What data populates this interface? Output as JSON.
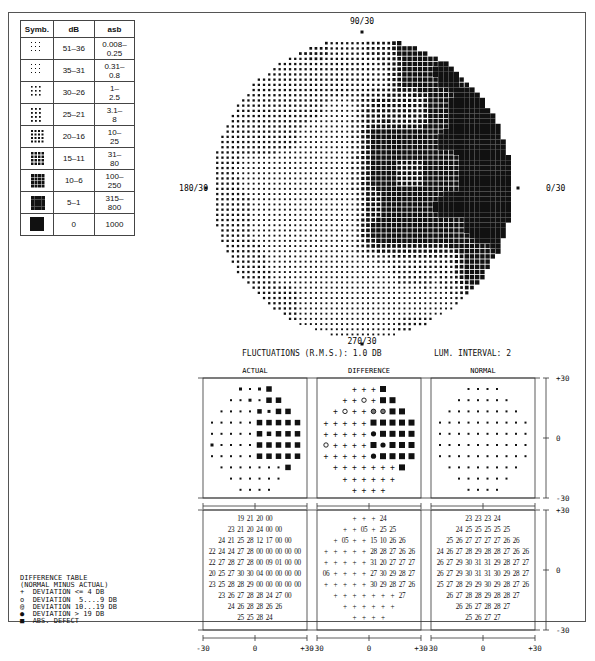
{
  "legend_table": {
    "headers": [
      "Symb.",
      "dB",
      "asb"
    ],
    "rows": [
      {
        "symbol": "dot-density-1",
        "db": "51–36",
        "asb": "0.008–0.25",
        "asb_l1": "0.008–",
        "asb_l2": "0.25"
      },
      {
        "symbol": "dot-density-2",
        "db": "35–31",
        "asb": "0.31–0.8",
        "asb_l1": "0.31–",
        "asb_l2": "0.8"
      },
      {
        "symbol": "dot-density-3",
        "db": "30–26",
        "asb": "1–2.5",
        "asb_l1": "1–",
        "asb_l2": "2.5"
      },
      {
        "symbol": "dot-density-4",
        "db": "25–21",
        "asb": "3.1–8",
        "asb_l1": "3.1–",
        "asb_l2": "8"
      },
      {
        "symbol": "dot-density-5",
        "db": "20–16",
        "asb": "10–25",
        "asb_l1": "10–",
        "asb_l2": "25"
      },
      {
        "symbol": "dot-density-6",
        "db": "15–11",
        "asb": "31–80",
        "asb_l1": "31–",
        "asb_l2": "80"
      },
      {
        "symbol": "dot-density-7",
        "db": "10–6",
        "asb": "100–250",
        "asb_l1": "100–",
        "asb_l2": "250"
      },
      {
        "symbol": "dot-density-8",
        "db": "5–1",
        "asb": "315–800",
        "asb_l1": "315–",
        "asb_l2": "800"
      },
      {
        "symbol": "solid-square",
        "db": "0",
        "asb": "1000",
        "asb_l1": "1000",
        "asb_l2": ""
      }
    ]
  },
  "field_plot": {
    "label_top": "90/30",
    "label_left": "180/30",
    "label_right": "0/30",
    "label_bottom": "270/30"
  },
  "stats": {
    "fluctuations": "FLUCTUATIONS (R.M.S.):  1.0 DB",
    "lum_interval": "LUM. INTERVAL: 2"
  },
  "panels": {
    "actual_title": "ACTUAL",
    "difference_title": "DIFFERENCE",
    "normal_title": "NORMAL",
    "x_ticks": [
      "-30",
      "0",
      "+30"
    ],
    "y_ticks": [
      "+30",
      "0",
      "-30"
    ]
  },
  "grid_rows_layout": [
    4,
    6,
    8,
    10,
    10,
    10,
    10,
    8,
    6,
    4
  ],
  "actual_values": [
    [
      "19",
      "21",
      "20",
      "00"
    ],
    [
      "23",
      "21",
      "20",
      "24",
      "00",
      "00"
    ],
    [
      "24",
      "21",
      "25",
      "28",
      "12",
      "17",
      "00",
      "00"
    ],
    [
      "22",
      "24",
      "24",
      "27",
      "28",
      "00",
      "00",
      "00",
      "00",
      "00"
    ],
    [
      "22",
      "27",
      "28",
      "27",
      "28",
      "00",
      "09",
      "01",
      "00",
      "00"
    ],
    [
      "20",
      "25",
      "27",
      "30",
      "30",
      "04",
      "00",
      "00",
      "00",
      "00"
    ],
    [
      "23",
      "25",
      "28",
      "28",
      "29",
      "00",
      "00",
      "00",
      "00",
      "00"
    ],
    [
      "23",
      "26",
      "27",
      "28",
      "28",
      "24",
      "27",
      "00"
    ],
    [
      "24",
      "26",
      "28",
      "28",
      "26",
      "26"
    ],
    [
      "25",
      "25",
      "28",
      "24"
    ]
  ],
  "difference_values": [
    [
      "+",
      "+",
      "+",
      "24"
    ],
    [
      "+",
      "+",
      "05",
      "+",
      "25",
      "25"
    ],
    [
      "+",
      "05",
      "+",
      "+",
      "15",
      "10",
      "26",
      "26"
    ],
    [
      "+",
      "+",
      "+",
      "+",
      "+",
      "28",
      "28",
      "27",
      "26",
      "26"
    ],
    [
      "+",
      "+",
      "+",
      "+",
      "+",
      "31",
      "20",
      "27",
      "27",
      "27"
    ],
    [
      "06",
      "+",
      "+",
      "+",
      "+",
      "27",
      "30",
      "29",
      "28",
      "27"
    ],
    [
      "+",
      "+",
      "+",
      "+",
      "+",
      "30",
      "29",
      "28",
      "27",
      "26"
    ],
    [
      "+",
      "+",
      "+",
      "+",
      "+",
      "+",
      "+",
      "27"
    ],
    [
      "+",
      "+",
      "+",
      "+",
      "+",
      "+"
    ],
    [
      "+",
      "+",
      "+",
      "+"
    ]
  ],
  "normal_values": [
    [
      "23",
      "23",
      "23",
      "24"
    ],
    [
      "24",
      "25",
      "25",
      "25",
      "25",
      "25"
    ],
    [
      "25",
      "26",
      "27",
      "27",
      "27",
      "27",
      "26",
      "26"
    ],
    [
      "24",
      "26",
      "27",
      "28",
      "29",
      "28",
      "28",
      "27",
      "26",
      "26"
    ],
    [
      "26",
      "27",
      "29",
      "30",
      "31",
      "31",
      "29",
      "28",
      "27",
      "27"
    ],
    [
      "26",
      "27",
      "29",
      "30",
      "31",
      "31",
      "30",
      "29",
      "28",
      "27"
    ],
    [
      "25",
      "27",
      "28",
      "29",
      "29",
      "30",
      "29",
      "28",
      "27",
      "26"
    ],
    [
      "26",
      "27",
      "28",
      "28",
      "29",
      "28",
      "28",
      "27"
    ],
    [
      "26",
      "26",
      "27",
      "28",
      "28",
      "27"
    ],
    [
      "25",
      "26",
      "27",
      "27"
    ]
  ],
  "difference_legend": {
    "title": "DIFFERENCE TABLE",
    "subtitle": "(NORMAL MINUS ACTUAL)",
    "items": [
      {
        "symbol": "+",
        "label": "DEVIATION <= 4 DB"
      },
      {
        "symbol": "o",
        "label": "DEVIATION  5....9 DB"
      },
      {
        "symbol": "ring-dot",
        "label": "DEVIATION 10...19 DB"
      },
      {
        "symbol": "filled-dot",
        "label": "DEVIATION > 19 DB"
      },
      {
        "symbol": "filled-square",
        "label": "ABS. DEFECT"
      }
    ]
  }
}
